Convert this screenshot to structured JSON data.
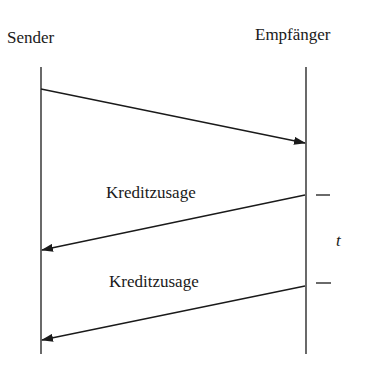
{
  "diagram": {
    "type": "sequence",
    "participants": [
      {
        "name": "Sender",
        "x": 41
      },
      {
        "name": "Empfänger",
        "x": 306
      }
    ],
    "messages": [
      {
        "from": "Sender",
        "to": "Empfänger",
        "label": ""
      },
      {
        "from": "Empfänger",
        "to": "Sender",
        "label": "Kreditzusage"
      },
      {
        "from": "Empfänger",
        "to": "Sender",
        "label": "Kreditzusage"
      }
    ],
    "time_axis_label": "t",
    "colors": {
      "line": "#1a1a1a",
      "background": "#ffffff"
    }
  }
}
